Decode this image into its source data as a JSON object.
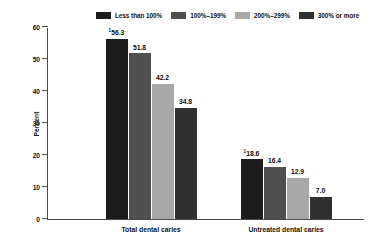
{
  "chart_data": {
    "type": "bar",
    "title": "",
    "subtitle": "",
    "xlabel": "",
    "ylabel": "Percent",
    "ylim": [
      0,
      60
    ],
    "yticks": [
      "0",
      "10",
      "20",
      "30",
      "40",
      "50",
      "60"
    ],
    "grid": false,
    "legend_position": "top",
    "categories": [
      "Total dental caries",
      "Untreated dental caries"
    ],
    "series": [
      {
        "name": "Less than 100%",
        "color": "#1c1c1c",
        "values": [
          56.3,
          18.6
        ],
        "labels": [
          "56.3",
          "18.6"
        ],
        "footnotes": [
          "1",
          "1"
        ]
      },
      {
        "name": "100%–199%",
        "color": "#4f4f4f",
        "values": [
          51.8,
          16.4
        ],
        "labels": [
          "51.8",
          "16.4"
        ],
        "footnotes": [
          "",
          ""
        ]
      },
      {
        "name": "200%–299%",
        "color": "#a8a8a8",
        "values": [
          42.2,
          12.9
        ],
        "labels": [
          "42.2",
          "12.9"
        ],
        "footnotes": [
          "",
          ""
        ]
      },
      {
        "name": "300% or more",
        "color": "#303030",
        "values": [
          34.8,
          7.0
        ],
        "labels": [
          "34.8",
          "7.0"
        ],
        "footnotes": [
          "",
          ""
        ]
      }
    ]
  },
  "axis": {
    "y_title": "Percent"
  }
}
